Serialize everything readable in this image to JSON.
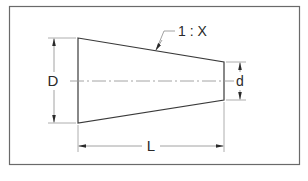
{
  "diagram": {
    "type": "taper-dimension-drawing",
    "labels": {
      "large_diameter": "D",
      "small_diameter": "d",
      "length": "L",
      "taper_ratio": "1 : X"
    },
    "colors": {
      "stroke": "#3a3a3a",
      "dim_line": "#8a8a8a",
      "centerline": "#9a9a9a",
      "frame": "#6a6a6a",
      "background": "#ffffff"
    }
  }
}
